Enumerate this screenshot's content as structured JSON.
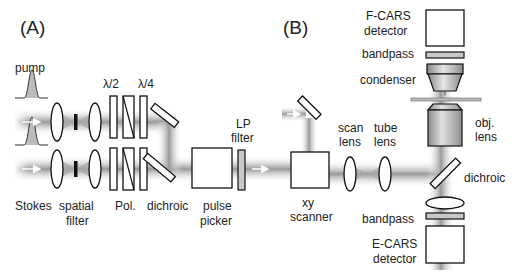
{
  "panels": {
    "A": {
      "label": "(A)",
      "labels": {
        "pump": "pump",
        "stokes": "Stokes",
        "spatial_filter_1": "spatial",
        "spatial_filter_2": "filter",
        "half_wave": "λ/2",
        "quarter_wave": "λ/4",
        "polarizer": "Pol.",
        "dichroic": "dichroic",
        "pulse_picker_1": "pulse",
        "pulse_picker_2": "picker",
        "lp_filter_1": "LP",
        "lp_filter_2": "filter"
      }
    },
    "B": {
      "label": "(B)",
      "labels": {
        "fcars_1": "F-CARS",
        "fcars_2": "detector",
        "bandpass_top": "bandpass",
        "condenser": "condenser",
        "scan_lens_1": "scan",
        "scan_lens_2": "lens",
        "tube_lens_1": "tube",
        "tube_lens_2": "lens",
        "obj_lens_1": "obj.",
        "obj_lens_2": "lens",
        "xy_scanner_1": "xy",
        "xy_scanner_2": "scanner",
        "dichroic": "dichroic",
        "bandpass_bottom": "bandpass",
        "ecars_1": "E-CARS",
        "ecars_2": "detector"
      }
    }
  },
  "colors": {
    "beam": "#b0b0b0",
    "component_fill": "#ffffff",
    "filter_fill": "#c8c8c8",
    "outline": "#111111"
  }
}
